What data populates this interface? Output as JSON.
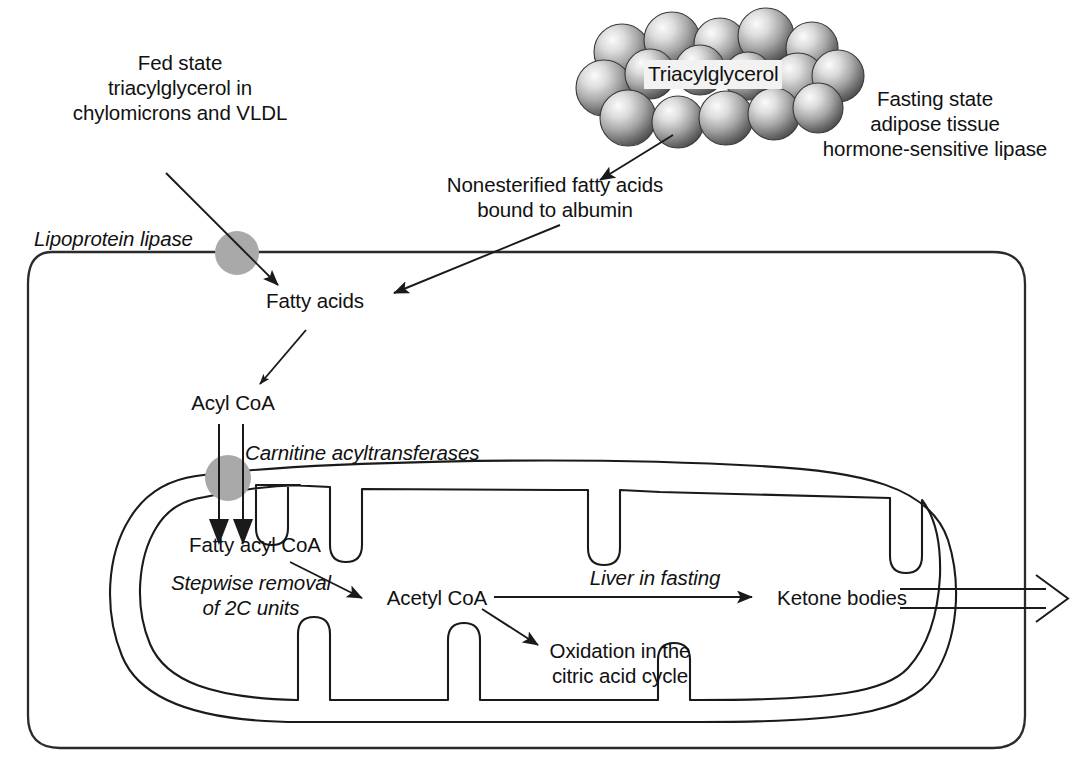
{
  "figure": {
    "type": "biochemical-pathway-diagram"
  },
  "labels": {
    "fed_state": "Fed state\ntriacylglycerol in\nchylomicrons and VLDL",
    "triacylglycerol": "Triacylglycerol",
    "fasting_state": "Fasting state\nadipose tissue\nhormone-sensitive lipase",
    "nefa": "Nonesterified fatty acids\nbound to albumin",
    "lipoprotein_lipase": "Lipoprotein lipase",
    "fatty_acids": "Fatty acids",
    "acyl_coa": "Acyl CoA",
    "carnitine_acyltransferases": "Carnitine acyltransferases",
    "fatty_acyl_coa": "Fatty acyl CoA",
    "stepwise_removal": "Stepwise removal\nof 2C units",
    "acetyl_coa": "Acetyl CoA",
    "liver_in_fasting": "Liver in fasting",
    "ketone_bodies": "Ketone bodies",
    "oxidation_citric": "Oxidation in the\ncitric acid cycle"
  },
  "colors": {
    "stroke": "#1a1a1a",
    "background": "#ffffff",
    "enzyme_circle": "#a9a9a9",
    "lipid_sphere_light": "#f0f0f0",
    "lipid_sphere_mid": "#9a9a9a",
    "lipid_sphere_dark": "#4a4a4a",
    "tag_label_bg": "#f2f2f2"
  },
  "structures": {
    "cell_membrane": "cell-outer-membrane",
    "mitochondrion": "mitochondrion-double-membrane-with-cristae",
    "lipid_droplet": "triacylglycerol-lipid-droplet",
    "enzyme_site_membrane": "lipoprotein-lipase-site",
    "enzyme_site_mito": "carnitine-acyltransferase-site"
  }
}
